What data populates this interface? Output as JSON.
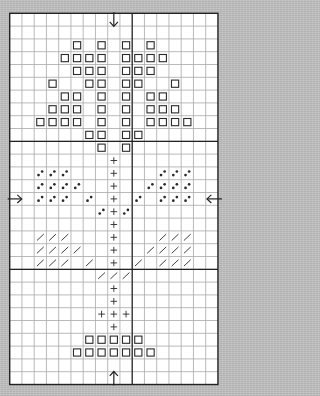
{
  "title": "",
  "pattern": {
    "columns": 17,
    "rows": 29,
    "major_lines": {
      "columns_after": [
        10
      ],
      "rows_after": [
        10,
        20
      ]
    },
    "colors": {
      "paper": "#ffffff",
      "grid_line": "#a8a8a8",
      "major_line": "#222222",
      "border": "#222222",
      "symbol": "#2a2a2a",
      "background": "#bfbfbf"
    },
    "legend": {
      "square": "open-square stitch",
      "dots": "diagonal-dots stitch",
      "plus": "plus stitch",
      "slash": "slash stitch"
    },
    "center_markers": [
      {
        "name": "top-center-arrow",
        "direction": "down",
        "column": 8
      },
      {
        "name": "bottom-center-arrow",
        "direction": "up",
        "column": 8
      },
      {
        "name": "left-center-arrow",
        "direction": "right",
        "row": 14
      },
      {
        "name": "right-center-arrow",
        "direction": "left",
        "row": 14
      }
    ],
    "cells": [
      {
        "row": 2,
        "square": [
          5,
          7,
          9,
          11
        ]
      },
      {
        "row": 3,
        "square": [
          4,
          5,
          6,
          7,
          9,
          10,
          11,
          12
        ]
      },
      {
        "row": 4,
        "square": [
          5,
          6,
          7,
          9,
          10,
          11
        ]
      },
      {
        "row": 5,
        "square": [
          3,
          6,
          7,
          9,
          10,
          13
        ]
      },
      {
        "row": 6,
        "square": [
          4,
          5,
          7,
          9,
          11,
          12
        ]
      },
      {
        "row": 7,
        "square": [
          3,
          4,
          5,
          7,
          9,
          11,
          12,
          13
        ]
      },
      {
        "row": 8,
        "square": [
          2,
          3,
          4,
          5,
          7,
          9,
          11,
          12,
          13,
          14
        ]
      },
      {
        "row": 9,
        "square": [
          6,
          7,
          9,
          10
        ]
      },
      {
        "row": 10,
        "square": [
          7,
          9
        ]
      },
      {
        "row": 11,
        "plus": [
          8
        ]
      },
      {
        "row": 12,
        "dots": [
          2,
          3,
          4,
          12,
          13,
          14
        ],
        "plus": [
          8
        ]
      },
      {
        "row": 13,
        "dots": [
          2,
          3,
          4,
          5,
          11,
          12,
          13,
          14
        ],
        "plus": [
          8
        ]
      },
      {
        "row": 14,
        "dots": [
          2,
          3,
          4,
          6,
          10,
          12,
          13,
          14
        ],
        "plus": [
          8
        ]
      },
      {
        "row": 15,
        "dots": [
          7,
          9
        ],
        "plus": [
          8
        ]
      },
      {
        "row": 16,
        "plus": [
          8
        ]
      },
      {
        "row": 17,
        "slash": [
          2,
          3,
          4,
          12,
          13,
          14
        ],
        "plus": [
          8
        ]
      },
      {
        "row": 18,
        "slash": [
          2,
          3,
          4,
          5,
          11,
          12,
          13,
          14
        ],
        "plus": [
          8
        ]
      },
      {
        "row": 19,
        "slash": [
          2,
          3,
          4,
          6,
          10,
          12,
          13,
          14
        ],
        "plus": [
          8
        ]
      },
      {
        "row": 20,
        "slash": [
          7,
          8,
          9
        ]
      },
      {
        "row": 21,
        "plus": [
          8
        ]
      },
      {
        "row": 22,
        "plus": [
          8
        ]
      },
      {
        "row": 23,
        "plus": [
          7,
          8,
          9
        ]
      },
      {
        "row": 24,
        "plus": [
          8
        ]
      },
      {
        "row": 25,
        "square": [
          6,
          7,
          8,
          9,
          10
        ]
      },
      {
        "row": 26,
        "square": [
          5,
          6,
          7,
          8,
          9,
          10,
          11
        ]
      }
    ]
  }
}
